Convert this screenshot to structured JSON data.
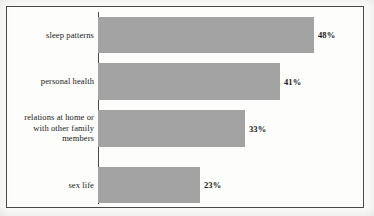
{
  "chart_data": {
    "type": "bar",
    "orientation": "horizontal",
    "title": "",
    "subtitle": "",
    "xlabel": "",
    "ylabel": "",
    "categories": [
      "sleep patterns",
      "personal health",
      "relations at home or with other family members",
      "sex life"
    ],
    "values": [
      48,
      41,
      33,
      23
    ],
    "value_labels": [
      "48%",
      "41%",
      "33%",
      "23%"
    ],
    "xlim": [
      0,
      59.5
    ],
    "grid": false,
    "legend": null,
    "series": [
      {
        "name": "",
        "values": [
          48,
          41,
          33,
          23
        ]
      }
    ],
    "bar_color": "#a3a3a3",
    "frame_color": "#4a4a4a",
    "text_color": "#1b1b1b",
    "background": "#fdfdfc"
  },
  "bars": [
    {
      "label_lines": [
        "sleep patterns"
      ],
      "value_label": "48%",
      "value": 48,
      "top": 17,
      "height": 36,
      "width_px": 216,
      "label_center": 35
    },
    {
      "label_lines": [
        "personal health"
      ],
      "value_label": "41%",
      "value": 41,
      "top": 63,
      "height": 37,
      "width_px": 182,
      "label_center": 81
    },
    {
      "label_lines": [
        "relations at home or",
        "with other family",
        "members"
      ],
      "value_label": "33%",
      "value": 33,
      "top": 110,
      "height": 37,
      "width_px": 147,
      "label_center": 128
    },
    {
      "label_lines": [
        "sex life"
      ],
      "value_label": "23%",
      "value": 23,
      "top": 167,
      "height": 36,
      "width_px": 102,
      "label_center": 185
    }
  ]
}
